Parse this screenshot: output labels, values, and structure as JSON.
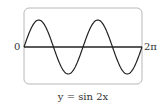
{
  "chart_data": {
    "type": "line",
    "title": "y = sin 2x",
    "function": "sin(2x)",
    "xlabel": "",
    "ylabel": "",
    "x_range": [
      0,
      6.2832
    ],
    "y_range": [
      -1,
      1
    ],
    "x_tick_labels": [
      "0",
      "2π"
    ],
    "grid": false,
    "legend": null,
    "series": [
      {
        "name": "y = sin 2x",
        "x": [
          0,
          0.3927,
          0.7854,
          1.1781,
          1.5708,
          1.9635,
          2.3562,
          2.7489,
          3.1416,
          3.5343,
          3.927,
          4.3197,
          4.7124,
          5.1051,
          5.4978,
          5.8905,
          6.2832
        ],
        "values": [
          0,
          0.7071,
          1,
          0.7071,
          0,
          -0.7071,
          -1,
          -0.7071,
          0,
          0.7071,
          1,
          0.7071,
          0,
          -0.7071,
          -1,
          -0.7071,
          0
        ]
      }
    ]
  },
  "labels": {
    "x_start": "0",
    "x_end": "2π",
    "caption": "y = sin 2x"
  },
  "style": {
    "curve_color": "#222222",
    "axis_color": "#222222",
    "frame_color": "#b8b8b8"
  }
}
